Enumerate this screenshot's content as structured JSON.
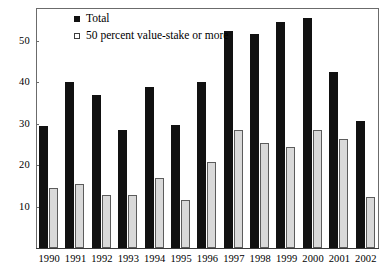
{
  "chart_data": {
    "type": "bar",
    "title": "",
    "subtitle": "",
    "xlabel": "",
    "ylabel": "",
    "grid": false,
    "legend_position": "top-left",
    "ylim": [
      0,
      58
    ],
    "yticks": [
      10,
      20,
      30,
      40,
      50
    ],
    "ytick_labels": [
      "10",
      "20",
      "30",
      "40",
      "50"
    ],
    "categories": [
      "1990",
      "1991",
      "1992",
      "1993",
      "1994",
      "1995",
      "1996",
      "1997",
      "1998",
      "1999",
      "2000",
      "2001",
      "2002"
    ],
    "series": [
      {
        "name": "Total",
        "color": "#111111",
        "values": [
          29.5,
          40.0,
          37.0,
          28.5,
          38.8,
          29.8,
          40.0,
          52.5,
          51.8,
          54.5,
          55.5,
          42.5,
          30.7
        ]
      },
      {
        "name": "50 percent value-stake or more",
        "color": "#d9d9d9",
        "values": [
          14.5,
          15.5,
          12.7,
          12.7,
          16.8,
          11.6,
          20.7,
          28.5,
          25.3,
          24.4,
          28.4,
          26.3,
          12.4
        ]
      }
    ]
  },
  "legend": {
    "items": [
      {
        "label": "Total",
        "marker": "filled-square"
      },
      {
        "label": "50 percent value-stake or more",
        "marker": "open-square"
      }
    ]
  },
  "colors": {
    "total_bar": "#111111",
    "stake_bar": "#d9d9d9",
    "stake_bar_border": "#5c5c5c",
    "axis": "#6b6b6b",
    "background": "#ffffff",
    "text": "#000000"
  }
}
